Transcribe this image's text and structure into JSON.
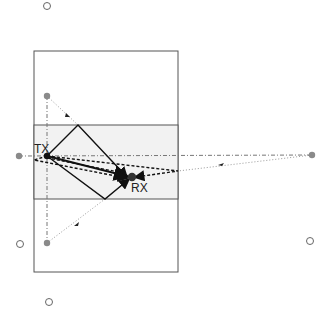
{
  "diagram": {
    "labels": {
      "tx": "TX",
      "rx": "RX"
    },
    "colors": {
      "room_border": "#555555",
      "corridor_fill": "#f2f2f2",
      "tx": "#111111",
      "rx": "#333333",
      "image_source": "#8a8a8a",
      "hollow_marker": "#666666",
      "path": "#111111",
      "image_path": "#888888"
    },
    "nodes": [
      {
        "id": "tx",
        "kind": "transmitter",
        "label": "TX"
      },
      {
        "id": "rx",
        "kind": "receiver",
        "label": "RX"
      },
      {
        "id": "img-top",
        "kind": "image-source"
      },
      {
        "id": "img-bottom",
        "kind": "image-source"
      },
      {
        "id": "img-left",
        "kind": "image-source"
      },
      {
        "id": "img-right",
        "kind": "image-source"
      },
      {
        "id": "hollow-top",
        "kind": "higher-order-image"
      },
      {
        "id": "hollow-left",
        "kind": "higher-order-image"
      },
      {
        "id": "hollow-right",
        "kind": "higher-order-image"
      },
      {
        "id": "hollow-bottom",
        "kind": "higher-order-image"
      }
    ],
    "paths": [
      {
        "id": "direct",
        "style": "solid"
      },
      {
        "id": "reflect-top-wall",
        "style": "solid"
      },
      {
        "id": "reflect-bottom-wall",
        "style": "solid"
      },
      {
        "id": "reflect-right-wall",
        "style": "dashed"
      },
      {
        "id": "reflect-left-wall",
        "style": "dashed"
      }
    ]
  }
}
